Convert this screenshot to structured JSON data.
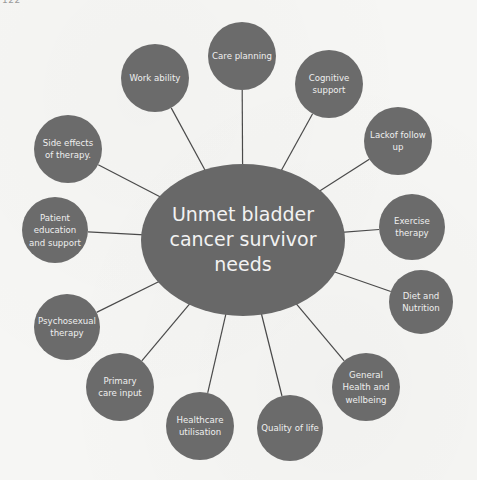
{
  "page": {
    "header_fragment": "122"
  },
  "diagram": {
    "type": "hub-and-spoke",
    "colors": {
      "node_fill": "#6b6b6b",
      "center_fill": "#686868",
      "text": "#efefef",
      "connector": "#4a4a4a",
      "background": "#f6f6f4"
    },
    "center": {
      "label_lines": [
        "Unmet bladder",
        "cancer survivor",
        "needs"
      ]
    },
    "nodes": [
      {
        "id": "care-planning",
        "label_lines": [
          "Care planning"
        ]
      },
      {
        "id": "cognitive-support",
        "label_lines": [
          "Cognitive",
          "support"
        ]
      },
      {
        "id": "lack-of-follow-up",
        "label_lines": [
          "Lackof follow",
          "up"
        ]
      },
      {
        "id": "exercise-therapy",
        "label_lines": [
          "Exercise",
          "therapy"
        ]
      },
      {
        "id": "diet-and-nutrition",
        "label_lines": [
          "Diet and",
          "Nutrition"
        ]
      },
      {
        "id": "general-health-and-wellbeing",
        "label_lines": [
          "General",
          "Health and",
          "wellbeing"
        ]
      },
      {
        "id": "quality-of-life",
        "label_lines": [
          "Quality of life"
        ]
      },
      {
        "id": "healthcare-utilisation",
        "label_lines": [
          "Healthcare",
          "utilisation"
        ]
      },
      {
        "id": "primary-care-input",
        "label_lines": [
          "Primary",
          "care input"
        ]
      },
      {
        "id": "psychosexual-therapy",
        "label_lines": [
          "Psychosexual",
          "therapy"
        ]
      },
      {
        "id": "patient-education-and-support",
        "label_lines": [
          "Patient",
          "education",
          "and support"
        ]
      },
      {
        "id": "side-effects-of-therapy",
        "label_lines": [
          "Side effects",
          "of therapy."
        ]
      },
      {
        "id": "work-ability",
        "label_lines": [
          "Work ability"
        ]
      }
    ]
  }
}
